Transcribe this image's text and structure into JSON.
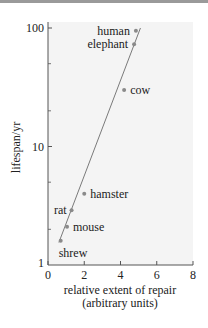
{
  "chart_data": {
    "type": "scatter",
    "title": "",
    "xlabel": "relative extent of repair",
    "xlabel_line2": "(arbitrary units)",
    "ylabel": "lifespan/yr",
    "xlim": [
      0,
      8
    ],
    "ylim": [
      1,
      100
    ],
    "yscale": "log",
    "x_ticks": [
      "0",
      "2",
      "4",
      "6",
      "8"
    ],
    "y_ticks": [
      "1",
      "10",
      "100"
    ],
    "grid": false,
    "legend": null,
    "points": [
      {
        "label": "human",
        "x": 4.85,
        "y": 95
      },
      {
        "label": "elephant",
        "x": 4.75,
        "y": 73
      },
      {
        "label": "cow",
        "x": 4.2,
        "y": 30
      },
      {
        "label": "hamster",
        "x": 2.0,
        "y": 4.0
      },
      {
        "label": "rat",
        "x": 1.3,
        "y": 2.9
      },
      {
        "label": "mouse",
        "x": 1.05,
        "y": 2.1
      },
      {
        "label": "shrew",
        "x": 0.7,
        "y": 1.6
      }
    ],
    "fit_line": {
      "from": {
        "x": 0.6,
        "y": 1.55
      },
      "to": {
        "x": 5.1,
        "y": 100
      }
    }
  },
  "colors": {
    "point": "#8a8a8a",
    "line": "#7a7a7a",
    "axis": "#555555",
    "plot_bg": "#f4f4f4"
  }
}
